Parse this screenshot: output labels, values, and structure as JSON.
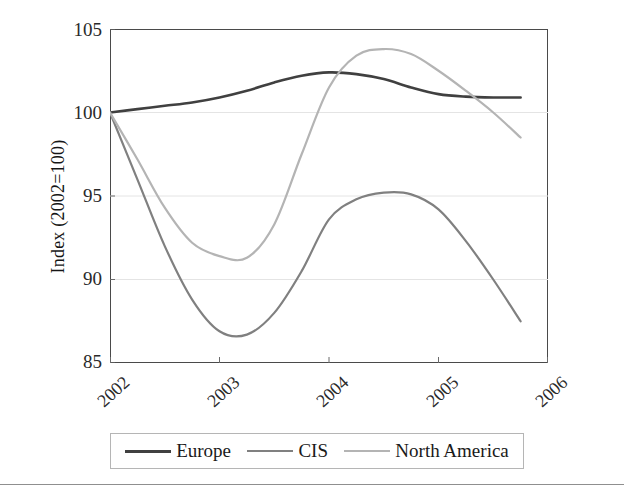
{
  "chart_data": {
    "type": "line",
    "title": "",
    "xlabel": "",
    "ylabel": "Index (2002=100)",
    "xlim": [
      2002,
      2006
    ],
    "ylim": [
      85,
      105
    ],
    "grid": true,
    "gridlines_y": [
      90,
      95,
      100
    ],
    "x_ticks": [
      "2002",
      "2003",
      "2004",
      "2005",
      "2006"
    ],
    "y_ticks": [
      "85",
      "90",
      "95",
      "100",
      "105"
    ],
    "legend_position": "bottom",
    "x": [
      2002,
      2002.25,
      2002.5,
      2002.75,
      2003,
      2003.25,
      2003.5,
      2003.75,
      2004,
      2004.25,
      2004.5,
      2004.75,
      2005,
      2005.25,
      2005.5,
      2005.75
    ],
    "series": [
      {
        "name": "Europe",
        "color": "#404040",
        "values": [
          100.0,
          100.2,
          100.4,
          100.6,
          100.9,
          101.3,
          101.8,
          102.2,
          102.4,
          102.3,
          102.0,
          101.5,
          101.1,
          100.95,
          100.9,
          100.9
        ]
      },
      {
        "name": "CIS",
        "color": "#808080",
        "values": [
          100.0,
          96.0,
          92.0,
          88.8,
          86.9,
          86.7,
          88.0,
          90.5,
          93.6,
          94.8,
          95.2,
          95.1,
          94.2,
          92.3,
          90.0,
          87.5
        ]
      },
      {
        "name": "North America",
        "color": "#b4b4b4",
        "values": [
          100.0,
          97.2,
          94.3,
          92.2,
          91.4,
          91.3,
          93.3,
          97.5,
          101.5,
          103.4,
          103.8,
          103.5,
          102.5,
          101.3,
          100.0,
          98.5
        ]
      }
    ]
  }
}
